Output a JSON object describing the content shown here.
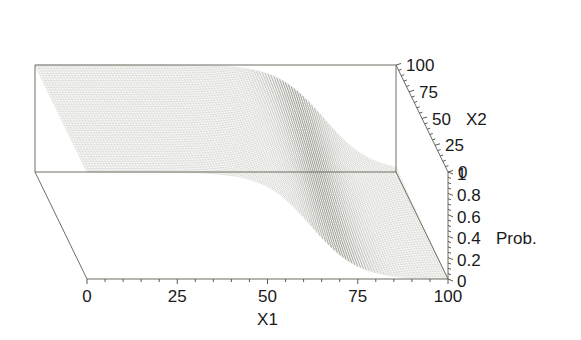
{
  "figure": {
    "type": "3d-surface-plot",
    "background": "#ffffff",
    "line_color": "#6e6e63",
    "mesh_color": "#8a8a7a",
    "text_color": "#1a1a1a"
  },
  "axes": {
    "x1": {
      "label": "X1",
      "ticks": [
        "0",
        "25",
        "50",
        "75",
        "100"
      ],
      "range": [
        0,
        100
      ],
      "minor_ticks_per_major": 5
    },
    "x2": {
      "label": "X2",
      "ticks": [
        "0",
        "25",
        "50",
        "75",
        "100"
      ],
      "range": [
        0,
        100
      ],
      "label_at_tick": "50"
    },
    "prob": {
      "label": "Prob.",
      "ticks": [
        "0",
        "0.2",
        "0.4",
        "0.6",
        "0.8",
        "1"
      ],
      "range": [
        0,
        1
      ],
      "label_at_tick": "0.4"
    }
  },
  "chart_data": {
    "type": "surface",
    "title": "",
    "xlabel": "X1",
    "ylabel": "X2",
    "zlabel": "Prob.",
    "xlim": [
      0,
      100
    ],
    "ylim": [
      0,
      100
    ],
    "zlim": [
      0,
      1
    ],
    "grid": true,
    "legend": null,
    "surface_model": {
      "form": "logistic",
      "expression": "P = 1 / (1 + exp((x1 - 62 - 0.18*x2) / 6.5))",
      "intercept": 9.54,
      "x1_coef": -0.154,
      "x2_coef": 0.0277
    },
    "x": [
      0,
      10,
      20,
      30,
      40,
      50,
      60,
      70,
      80,
      90,
      100
    ],
    "y": [
      0,
      10,
      20,
      30,
      40,
      50,
      60,
      70,
      80,
      90,
      100
    ],
    "z": [
      [
        1.0,
        1.0,
        1.0,
        0.99,
        0.98,
        0.93,
        0.72,
        0.3,
        0.06,
        0.01,
        0.0
      ],
      [
        1.0,
        1.0,
        1.0,
        0.99,
        0.98,
        0.95,
        0.78,
        0.38,
        0.08,
        0.01,
        0.0
      ],
      [
        1.0,
        1.0,
        1.0,
        1.0,
        0.99,
        0.96,
        0.83,
        0.47,
        0.12,
        0.02,
        0.0
      ],
      [
        1.0,
        1.0,
        1.0,
        1.0,
        0.99,
        0.97,
        0.87,
        0.56,
        0.17,
        0.03,
        0.0
      ],
      [
        1.0,
        1.0,
        1.0,
        1.0,
        0.99,
        0.98,
        0.9,
        0.64,
        0.24,
        0.04,
        0.01
      ],
      [
        1.0,
        1.0,
        1.0,
        1.0,
        1.0,
        0.98,
        0.93,
        0.72,
        0.32,
        0.06,
        0.01
      ],
      [
        1.0,
        1.0,
        1.0,
        1.0,
        1.0,
        0.99,
        0.95,
        0.78,
        0.41,
        0.09,
        0.01
      ],
      [
        1.0,
        1.0,
        1.0,
        1.0,
        1.0,
        0.99,
        0.96,
        0.84,
        0.51,
        0.14,
        0.02
      ],
      [
        1.0,
        1.0,
        1.0,
        1.0,
        1.0,
        0.99,
        0.97,
        0.88,
        0.6,
        0.2,
        0.03
      ],
      [
        1.0,
        1.0,
        1.0,
        1.0,
        1.0,
        1.0,
        0.98,
        0.91,
        0.69,
        0.28,
        0.05
      ],
      [
        1.0,
        1.0,
        1.0,
        1.0,
        1.0,
        1.0,
        0.99,
        0.94,
        0.76,
        0.37,
        0.08
      ]
    ]
  }
}
